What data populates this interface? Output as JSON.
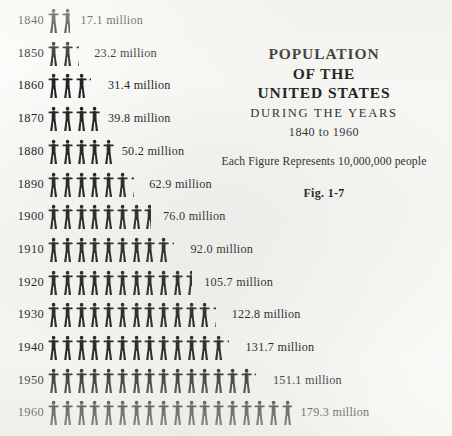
{
  "title": {
    "line1": "POPULATION",
    "line2": "OF THE",
    "line3": "UNITED STATES",
    "during": "DURING THE YEARS",
    "range": "1840 to 1960"
  },
  "legend": {
    "note": "Each Figure Represents 10,000,000 people",
    "figure_number": "Fig. 1-7"
  },
  "colors": {
    "ink": "#171717",
    "figure": "#1c1c1c",
    "paper": "#fdfdfb"
  },
  "chart_data": {
    "type": "bar",
    "subtype": "pictograph",
    "title": "POPULATION OF THE UNITED STATES",
    "subtitle": "DURING THE YEARS 1840 to 1960",
    "annotation": "Each Figure Represents 10,000,000 people",
    "figure_caption": "Fig. 1-7",
    "unit_per_icon": 10000000,
    "unit_label": "million",
    "xlabel": "Population (millions)",
    "ylabel": "Year",
    "grid": false,
    "legend_position": "top-right",
    "categories": [
      "1840",
      "1850",
      "1860",
      "1870",
      "1880",
      "1890",
      "1900",
      "1910",
      "1920",
      "1930",
      "1940",
      "1950",
      "1960"
    ],
    "values": [
      17.1,
      23.2,
      31.4,
      39.8,
      50.2,
      62.9,
      76.0,
      92.0,
      105.7,
      122.8,
      131.7,
      151.1,
      179.3
    ],
    "value_labels": [
      "17.1 million",
      "23.2 million",
      "31.4 million",
      "39.8 million",
      "50.2 million",
      "62.9 million",
      "76.0 million",
      "92.0 million",
      "105.7 million",
      "122.8 million",
      "131.7 million",
      "151.1 million",
      "179.3 million"
    ],
    "xlim": [
      0,
      180
    ],
    "rows": [
      {
        "year": "1840",
        "value": 17.1,
        "label": "17.1 million",
        "icons": 1.71
      },
      {
        "year": "1850",
        "value": 23.2,
        "label": "23.2 million",
        "icons": 2.32
      },
      {
        "year": "1860",
        "value": 31.4,
        "label": "31.4 million",
        "icons": 3.14
      },
      {
        "year": "1870",
        "value": 39.8,
        "label": "39.8 million",
        "icons": 3.98
      },
      {
        "year": "1880",
        "value": 50.2,
        "label": "50.2 million",
        "icons": 5.02
      },
      {
        "year": "1890",
        "value": 62.9,
        "label": "62.9 million",
        "icons": 6.29
      },
      {
        "year": "1900",
        "value": 76.0,
        "label": "76.0 million",
        "icons": 7.6
      },
      {
        "year": "1910",
        "value": 92.0,
        "label": "92.0 million",
        "icons": 9.2
      },
      {
        "year": "1920",
        "value": 105.7,
        "label": "105.7 million",
        "icons": 10.57
      },
      {
        "year": "1930",
        "value": 122.8,
        "label": "122.8 million",
        "icons": 12.28
      },
      {
        "year": "1940",
        "value": 131.7,
        "label": "131.7 million",
        "icons": 13.17
      },
      {
        "year": "1950",
        "value": 151.1,
        "label": "151.1 million",
        "icons": 15.11
      },
      {
        "year": "1960",
        "value": 179.3,
        "label": "179.3 million",
        "icons": 17.93
      }
    ]
  }
}
